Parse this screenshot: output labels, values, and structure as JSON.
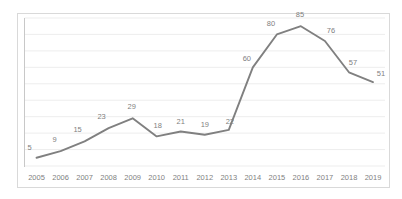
{
  "chart_data": {
    "type": "line",
    "title": "",
    "subtitle": "",
    "xlabel": "",
    "ylabel": "",
    "categories": [
      "2005",
      "2006",
      "2007",
      "2008",
      "2009",
      "2010",
      "2011",
      "2012",
      "2013",
      "2014",
      "2015",
      "2016",
      "2017",
      "2018",
      "2019"
    ],
    "values": [
      5,
      9,
      15,
      23,
      29,
      18,
      21,
      19,
      22,
      60,
      80,
      85,
      76,
      57,
      51
    ],
    "data_labels": [
      "5",
      "9",
      "15",
      "23",
      "29",
      "18",
      "21",
      "19",
      "22",
      "60",
      "80",
      "85",
      "76",
      "57",
      "51"
    ],
    "series": [
      {
        "name": "",
        "values": [
          5,
          9,
          15,
          23,
          29,
          18,
          21,
          19,
          22,
          60,
          80,
          85,
          76,
          57,
          51
        ]
      }
    ],
    "ylim": [
      0,
      90
    ],
    "xlim_categories": 15,
    "grid": true,
    "grid_orientation": "horizontal",
    "gridline_count": 9,
    "legend": false,
    "legend_position": "none",
    "show_markers": false,
    "show_data_labels": true,
    "axis_line": "left-and-bottom-implicit",
    "colors": {
      "line": "#808080",
      "gridline": "#ededed",
      "axis_line": "#c8c8c8",
      "border": "#d9d9d9",
      "label_text": "#7f7f7f",
      "tick_text": "#7f7f7f",
      "background": "#ffffff"
    }
  }
}
